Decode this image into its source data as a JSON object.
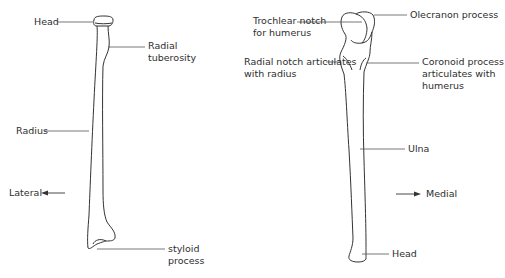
{
  "radius": {
    "labels": {
      "head": "Head",
      "radial_tuberosity": [
        "Radial",
        "tuberosity"
      ],
      "radius": "Radius",
      "styloid_process": [
        "styloid",
        "process"
      ]
    }
  },
  "ulna": {
    "labels": {
      "trochlear_notch": [
        "Trochlear notch",
        "for humerus"
      ],
      "olecranon_process": "Olecranon process",
      "radial_notch": [
        "Radial notch articulates",
        "with radius"
      ],
      "coronoid_process": [
        "Coronoid process",
        "articulates with",
        "humerus"
      ],
      "ulna": "Ulna",
      "head": "Head"
    }
  },
  "orientation": {
    "lateral": "Lateral",
    "medial": "Medial"
  },
  "colors": {
    "line": "#333333",
    "leader": "#555555",
    "text": "#2e2e2e"
  }
}
